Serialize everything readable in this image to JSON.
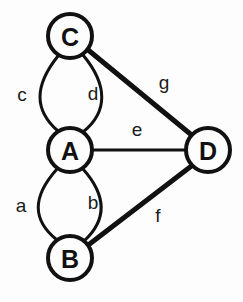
{
  "diagram": {
    "background_color": "#fdfdfd",
    "stroke_color": "#111111",
    "nodes": [
      {
        "id": "C",
        "label": "C",
        "cx": 70,
        "cy": 36,
        "r": 22,
        "stroke_width": 4
      },
      {
        "id": "A",
        "label": "A",
        "cx": 70,
        "cy": 150,
        "r": 22,
        "stroke_width": 4
      },
      {
        "id": "B",
        "label": "B",
        "cx": 70,
        "cy": 258,
        "r": 22,
        "stroke_width": 4
      },
      {
        "id": "D",
        "label": "D",
        "cx": 208,
        "cy": 150,
        "r": 22,
        "stroke_width": 4
      }
    ],
    "edges": [
      {
        "id": "c",
        "label": "c",
        "from": "C",
        "to": "A",
        "kind": "curve",
        "bow": "left",
        "stroke_width": 3,
        "path": "M 58 56 C 34 86 34 110 58 131",
        "label_x": 22,
        "label_y": 94
      },
      {
        "id": "d",
        "label": "d",
        "from": "C",
        "to": "A",
        "kind": "curve",
        "bow": "right",
        "stroke_width": 3,
        "path": "M 83 55 C 108 85 108 112 83 132",
        "label_x": 93,
        "label_y": 93
      },
      {
        "id": "a",
        "label": "a",
        "from": "A",
        "to": "B",
        "kind": "curve",
        "bow": "left",
        "stroke_width": 3,
        "path": "M 57 169 C 32 197 32 220 57 240",
        "label_x": 21,
        "label_y": 205
      },
      {
        "id": "b",
        "label": "b",
        "from": "A",
        "to": "B",
        "kind": "curve",
        "bow": "right",
        "stroke_width": 3,
        "path": "M 83 169 C 107 196 107 220 84 241",
        "label_x": 93,
        "label_y": 202
      },
      {
        "id": "e",
        "label": "e",
        "from": "A",
        "to": "D",
        "kind": "line",
        "stroke_width": 3,
        "path": "M 92 150 L 186 150",
        "label_x": 137,
        "label_y": 129
      },
      {
        "id": "g",
        "label": "g",
        "from": "C",
        "to": "D",
        "kind": "line",
        "stroke_width": 5,
        "path": "M 87 49 L 194 137",
        "label_x": 164,
        "label_y": 82
      },
      {
        "id": "f",
        "label": "f",
        "from": "B",
        "to": "D",
        "kind": "line",
        "stroke_width": 5,
        "path": "M 87 246 L 194 164",
        "label_x": 158,
        "label_y": 215
      }
    ]
  }
}
